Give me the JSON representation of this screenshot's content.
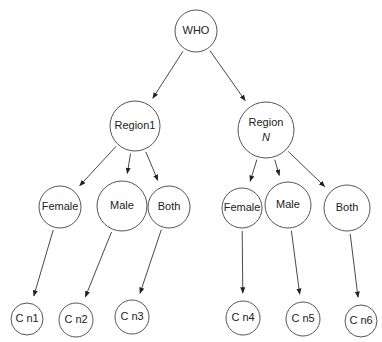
{
  "diagram": {
    "type": "tree",
    "nodes": [
      {
        "id": "who",
        "label": "WHO",
        "cx": 196,
        "cy": 31,
        "r": 21
      },
      {
        "id": "region1",
        "label": "Region1",
        "cx": 135,
        "cy": 126,
        "r": 25
      },
      {
        "id": "regionN",
        "label": "Region",
        "label2": "N",
        "cx": 266,
        "cy": 130,
        "r": 28
      },
      {
        "id": "female1",
        "label": "Female",
        "cx": 60,
        "cy": 207,
        "r": 21
      },
      {
        "id": "male1",
        "label": "Male",
        "cx": 122,
        "cy": 206,
        "r": 25
      },
      {
        "id": "both1",
        "label": "Both",
        "cx": 169,
        "cy": 207,
        "r": 21
      },
      {
        "id": "female2",
        "label": "Female",
        "cx": 242,
        "cy": 208,
        "r": 20
      },
      {
        "id": "male2",
        "label": "Male",
        "cx": 288,
        "cy": 205,
        "r": 23
      },
      {
        "id": "both2",
        "label": "Both",
        "cx": 347,
        "cy": 208,
        "r": 23
      },
      {
        "id": "cn1",
        "label": "C n1",
        "cx": 27,
        "cy": 319,
        "r": 16
      },
      {
        "id": "cn2",
        "label": "C n2",
        "cx": 76,
        "cy": 320,
        "r": 17
      },
      {
        "id": "cn3",
        "label": "C n3",
        "cx": 132,
        "cy": 317,
        "r": 17
      },
      {
        "id": "cn4",
        "label": "C n4",
        "cx": 243,
        "cy": 318,
        "r": 17
      },
      {
        "id": "cn5",
        "label": "C n5",
        "cx": 303,
        "cy": 319,
        "r": 17
      },
      {
        "id": "cn6",
        "label": "C n6",
        "cx": 361,
        "cy": 321,
        "r": 16
      }
    ],
    "edges": [
      {
        "from": "who",
        "to": "region1"
      },
      {
        "from": "who",
        "to": "regionN"
      },
      {
        "from": "region1",
        "to": "female1"
      },
      {
        "from": "region1",
        "to": "male1"
      },
      {
        "from": "region1",
        "to": "both1"
      },
      {
        "from": "regionN",
        "to": "female2"
      },
      {
        "from": "regionN",
        "to": "male2"
      },
      {
        "from": "regionN",
        "to": "both2"
      },
      {
        "from": "female1",
        "to": "cn1"
      },
      {
        "from": "male1",
        "to": "cn2"
      },
      {
        "from": "both1",
        "to": "cn3"
      },
      {
        "from": "female2",
        "to": "cn4"
      },
      {
        "from": "male2",
        "to": "cn5"
      },
      {
        "from": "both2",
        "to": "cn6"
      }
    ],
    "colors": {
      "stroke": "#555555",
      "edge": "#333333",
      "text": "#222222",
      "background": "#ffffff"
    }
  }
}
